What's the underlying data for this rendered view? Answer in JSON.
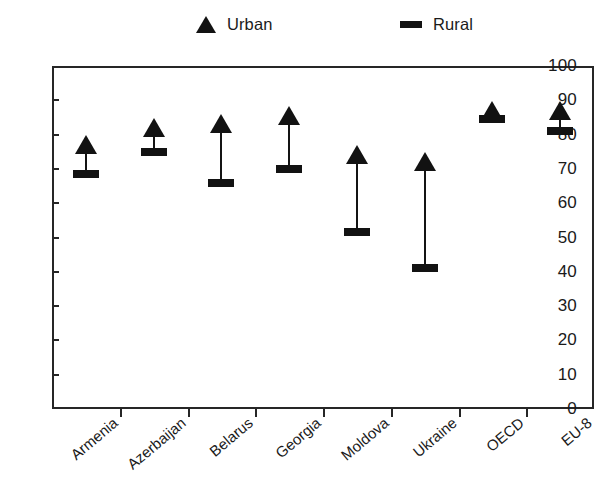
{
  "legend": {
    "entries": [
      {
        "label": "Urban",
        "marker": "triangle-up-icon",
        "color": "#121212"
      },
      {
        "label": "Rural",
        "marker": "dash-icon",
        "color": "#121212"
      }
    ]
  },
  "axes": {
    "y_ticks": [
      "100",
      "90",
      "80",
      "70",
      "60",
      "50",
      "40",
      "30",
      "20",
      "10",
      "0"
    ]
  },
  "chart_data": {
    "type": "scatter",
    "title": "",
    "subtitle": "",
    "xlabel": "",
    "ylabel": "",
    "ylim": [
      0,
      100
    ],
    "ytick_step": 10,
    "grid": false,
    "legend_position": "top-center",
    "annotations": [],
    "categories": [
      "Armenia",
      "Azerbaijan",
      "Belarus",
      "Georgia",
      "Moldova",
      "Ukraine",
      "OECD",
      "EU-8"
    ],
    "series": [
      {
        "name": "Urban",
        "marker": "triangle",
        "color": "#121212",
        "values": [
          77,
          82,
          83,
          85.5,
          74,
          72,
          87,
          87
        ]
      },
      {
        "name": "Rural",
        "marker": "dash",
        "color": "#121212",
        "values": [
          68.5,
          75,
          66,
          70,
          51.5,
          41,
          84.5,
          81
        ]
      }
    ]
  }
}
